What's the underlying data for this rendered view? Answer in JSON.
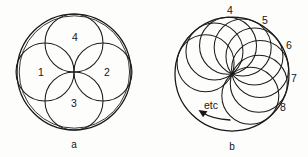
{
  "figure": {
    "name": "two-part-geometry-figure",
    "background_color": "#fdfdfc",
    "ink_color": "#1b1b1b",
    "width": 308,
    "height": 157
  },
  "panel_a": {
    "caption": "a",
    "caption_x": 74,
    "caption_y": 148,
    "outer_circle": {
      "cx": 74,
      "cy": 72,
      "rx": 57,
      "ry": 58
    },
    "petal_radius": 29,
    "petals": [
      {
        "label": "4",
        "position": "top",
        "cx": 74,
        "cy": 43,
        "label_x": 75,
        "label_y": 41
      },
      {
        "label": "1",
        "position": "left",
        "cx": 45,
        "cy": 72,
        "label_x": 41,
        "label_y": 76
      },
      {
        "label": "2",
        "position": "right",
        "cx": 103,
        "cy": 72,
        "label_x": 107,
        "label_y": 76
      },
      {
        "label": "3",
        "position": "bottom",
        "cx": 74,
        "cy": 101,
        "label_x": 74,
        "label_y": 107
      }
    ]
  },
  "panel_b": {
    "caption": "b",
    "caption_x": 232,
    "caption_y": 150,
    "outer_circle": {
      "cx": 232,
      "cy": 74,
      "r": 57
    },
    "pivot": {
      "x": 232,
      "y": 74
    },
    "rolling_radius": 28.5,
    "rolling_circles": [
      {
        "index": 1,
        "angle_deg": -158
      },
      {
        "index": 2,
        "angle_deg": -128
      },
      {
        "index": 3,
        "angle_deg": -98
      },
      {
        "index": 4,
        "angle_deg": -68,
        "label": "4",
        "label_x": 230,
        "label_y": 14
      },
      {
        "index": 5,
        "angle_deg": -38,
        "label": "5",
        "label_x": 265,
        "label_y": 24
      },
      {
        "index": 6,
        "angle_deg": -10,
        "label": "6",
        "label_x": 288,
        "label_y": 49
      },
      {
        "index": 7,
        "angle_deg": 20,
        "label": "7",
        "label_x": 293,
        "label_y": 82
      },
      {
        "index": 8,
        "angle_deg": 50,
        "label": "8",
        "label_x": 282,
        "label_y": 111
      }
    ],
    "etc_note": {
      "text": "etc",
      "x": 210,
      "y": 109
    },
    "direction_arrow": {
      "path": "M 229 119 C 219 118 208 116 200 111",
      "head_points": "200,111 208,112 204,117"
    }
  }
}
